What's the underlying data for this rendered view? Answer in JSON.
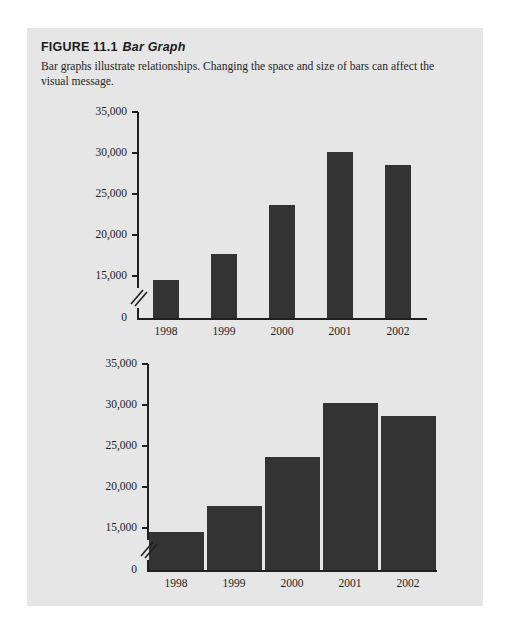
{
  "figure": {
    "label": "FIGURE 11.1",
    "subject": "Bar Graph",
    "description": "Bar graphs illustrate relationships. Changing the space and size of bars can affect the visual message."
  },
  "colors": {
    "panel_background": "#e6e6e6",
    "page_background": "#ffffff",
    "bar_fill": "#333333",
    "axis": "#202020",
    "text": "#1d1d1d"
  },
  "chart_data": [
    {
      "type": "bar",
      "id": "narrow-bars-chart",
      "title": "",
      "xlabel": "",
      "ylabel": "",
      "categories": [
        "1998",
        "1999",
        "2000",
        "2001",
        "2002"
      ],
      "values": [
        14500,
        17700,
        23700,
        30100,
        28500
      ],
      "ytick_labels": [
        "35,000",
        "30,000",
        "25,000",
        "20,000",
        "15,000",
        "0"
      ],
      "ytick_values": [
        35000,
        30000,
        25000,
        20000,
        15000,
        0
      ],
      "ylim": [
        13000,
        35000
      ],
      "axis_break": true,
      "axis_break_between": [
        15000,
        0
      ],
      "grid": false,
      "legend": "none",
      "bar_style": "narrow-wide-gaps"
    },
    {
      "type": "bar",
      "id": "wide-bars-chart",
      "title": "",
      "xlabel": "",
      "ylabel": "",
      "categories": [
        "1998",
        "1999",
        "2000",
        "2001",
        "2002"
      ],
      "values": [
        14500,
        17700,
        23700,
        30300,
        28700
      ],
      "ytick_labels": [
        "35,000",
        "30,000",
        "25,000",
        "20,000",
        "15,000",
        "0"
      ],
      "ytick_values": [
        35000,
        30000,
        25000,
        20000,
        15000,
        0
      ],
      "ylim": [
        13000,
        35000
      ],
      "axis_break": true,
      "axis_break_between": [
        15000,
        0
      ],
      "grid": false,
      "legend": "none",
      "bar_style": "wide-narrow-gaps"
    }
  ]
}
